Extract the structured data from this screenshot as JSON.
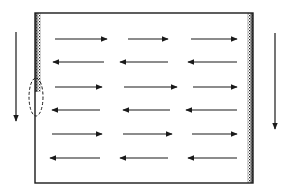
{
  "diagram": {
    "type": "flow-field",
    "colors": {
      "background": "#ffffff",
      "line": "#1a1a1a",
      "shading": "#3a3a3a"
    },
    "box": {
      "x": 35,
      "y": 13,
      "width": 218,
      "height": 170
    },
    "left_wall_shading": {
      "x": 35,
      "y_top": 13,
      "y_bottom": 92,
      "width": 6
    },
    "right_wall_shading": {
      "x": 247,
      "y_top": 13,
      "y_bottom": 183,
      "width": 6
    },
    "dashed_ellipse": {
      "cx": 36,
      "cy": 97,
      "rx": 7,
      "ry": 19
    },
    "external_arrows": [
      {
        "name": "left-down-arrow",
        "x": 16,
        "y1": 32,
        "y2": 121,
        "direction": "down"
      },
      {
        "name": "right-down-arrow",
        "x": 275,
        "y1": 33,
        "y2": 129,
        "direction": "down"
      }
    ],
    "flow_rows": [
      {
        "y": 39,
        "direction": "right",
        "segments": [
          [
            55,
            107
          ],
          [
            128,
            168
          ],
          [
            191,
            237
          ]
        ]
      },
      {
        "y": 62,
        "direction": "left",
        "segments": [
          [
            53,
            104
          ],
          [
            120,
            168
          ],
          [
            188,
            237
          ]
        ]
      },
      {
        "y": 87,
        "direction": "right",
        "segments": [
          [
            55,
            102
          ],
          [
            124,
            177
          ],
          [
            193,
            237
          ]
        ]
      },
      {
        "y": 110,
        "direction": "left",
        "segments": [
          [
            52,
            100
          ],
          [
            123,
            170
          ],
          [
            186,
            237
          ]
        ]
      },
      {
        "y": 134,
        "direction": "right",
        "segments": [
          [
            52,
            102
          ],
          [
            123,
            172
          ],
          [
            192,
            237
          ]
        ]
      },
      {
        "y": 158,
        "direction": "left",
        "segments": [
          [
            50,
            100
          ],
          [
            120,
            168
          ],
          [
            188,
            237
          ]
        ]
      }
    ]
  }
}
